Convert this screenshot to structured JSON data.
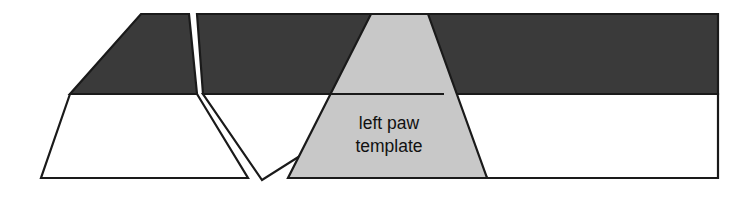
{
  "figure": {
    "name": "left-paw-template-diagram",
    "background_color": "#ffffff",
    "outline_color": "#1a1a1a",
    "width": 755,
    "height": 203,
    "caption": {
      "line1": "left paw",
      "line2": "template",
      "full_text": "left paw template",
      "color": "#111111"
    },
    "colors": {
      "dark_fill": "#3a3a3a",
      "light_fill": "#c8c8c8",
      "white_fill": "#ffffff",
      "outline": "#1a1a1a"
    },
    "shapes": [
      {
        "id": "shape-1",
        "label": "left trapezoid",
        "upper_fill": "#3a3a3a",
        "lower_fill": "#ffffff",
        "points": "141,14 189,14 248,178 41,178",
        "upper_points": "141,14 189,14 197,94 70,94",
        "lower_points": "70,94 197,94 248,178 41,178",
        "divider": "70,94 197,94"
      },
      {
        "id": "shape-2",
        "label": "middle inverted trapezoid",
        "upper_fill": "#3a3a3a",
        "lower_fill": "#ffffff",
        "points": "197,14 427,14 262,180 206,86",
        "upper_points": "197,14 427,14 398,94 203,94",
        "lower_points": "203,94 398,94 262,180",
        "divider": "203,94 398,94"
      },
      {
        "id": "shape-3",
        "label": "right light-gray trapezoid (left paw template)",
        "upper_fill": "#c8c8c8",
        "lower_fill": "#c8c8c8",
        "points": "371,14 428,14 487,178 288,178",
        "divider": "317,94 444,94"
      },
      {
        "id": "shape-4",
        "label": "right band",
        "upper_fill": "#3a3a3a",
        "lower_fill": "#ffffff",
        "points": "428,14 718,14 718,178 487,178",
        "upper_points": "428,14 718,14 718,94 444,94",
        "lower_points": "444,94 718,94 718,178 487,178",
        "divider": "444,94 718,94"
      }
    ]
  }
}
